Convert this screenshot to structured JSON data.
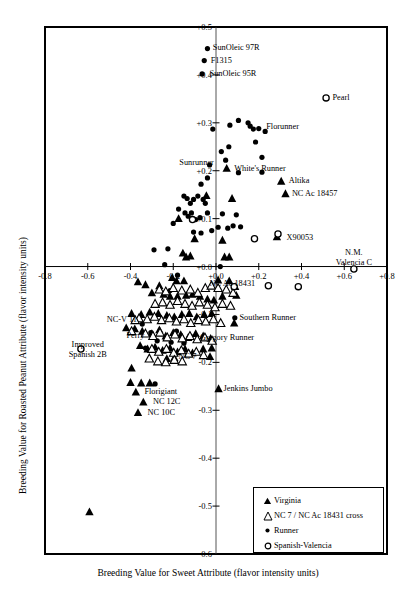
{
  "chart_data": {
    "type": "scatter",
    "title": "",
    "xlabel": "Breeding Value for Sweet Attribute (flavor intensity units)",
    "ylabel": "Breeding Value for Roasted Peanut Attribute (flavor intensity units)",
    "xlim": [
      -0.8,
      0.8
    ],
    "ylim": [
      -0.6,
      0.5
    ],
    "xticks": [
      "-0.8",
      "-0.6",
      "-0.4",
      "-0.2",
      "+0.0",
      "+0.2",
      "+0.4",
      "+0.6",
      "+0.8"
    ],
    "xtick_values": [
      -0.8,
      -0.6,
      -0.4,
      -0.2,
      0.0,
      0.2,
      0.4,
      0.6,
      0.8
    ],
    "yticks": [
      "+0.5",
      "+0.4",
      "+0.3",
      "+0.2",
      "+0.1",
      "+0.0",
      "-0.1",
      "-0.2",
      "-0.3",
      "-0.4",
      "-0.5",
      "-0.6"
    ],
    "ytick_values": [
      0.5,
      0.4,
      0.3,
      0.2,
      0.1,
      0.0,
      -0.1,
      -0.2,
      -0.3,
      -0.4,
      -0.5,
      -0.6
    ],
    "grid": false,
    "legend_position": "bottom-right",
    "legend": [
      {
        "label": "Virginia",
        "marker": "filled-triangle"
      },
      {
        "label": "NC 7 / NC Ac 18431 cross",
        "marker": "open-triangle"
      },
      {
        "label": "Runner",
        "marker": "filled-circle"
      },
      {
        "label": "Spanish-Valencia",
        "marker": "open-circle"
      }
    ],
    "annotations": [
      {
        "text": "SunOleic 97R",
        "x": -0.015,
        "y": 0.456,
        "anchor": "l"
      },
      {
        "text": "F1315",
        "x": -0.025,
        "y": 0.43,
        "anchor": "l"
      },
      {
        "text": "SunOleic 95R",
        "x": -0.03,
        "y": 0.402,
        "anchor": "l"
      },
      {
        "text": "Pearl",
        "x": 0.545,
        "y": 0.352,
        "anchor": "l"
      },
      {
        "text": "Florunner",
        "x": 0.235,
        "y": 0.292,
        "anchor": "l"
      },
      {
        "text": "Sunrunner",
        "x": -0.01,
        "y": 0.216,
        "anchor": "r"
      },
      {
        "text": "White's Runner",
        "x": 0.085,
        "y": 0.203,
        "anchor": "l"
      },
      {
        "text": "Altika",
        "x": 0.34,
        "y": 0.178,
        "anchor": "l"
      },
      {
        "text": "NC Ac 18457",
        "x": 0.355,
        "y": 0.152,
        "anchor": "l"
      },
      {
        "text": "X90053",
        "x": 0.33,
        "y": 0.06,
        "anchor": "l"
      },
      {
        "text": "N.M.",
        "x": 0.645,
        "y": 0.028,
        "anchor": "c"
      },
      {
        "text": "Valencia C",
        "x": 0.645,
        "y": 0.007,
        "anchor": "c"
      },
      {
        "text": "NC Ac 18431",
        "x": -0.03,
        "y": -0.037,
        "anchor": "l"
      },
      {
        "text": "Southern Runner",
        "x": 0.11,
        "y": -0.108,
        "anchor": "l"
      },
      {
        "text": "NC-V 11",
        "x": -0.37,
        "y": -0.112,
        "anchor": "r"
      },
      {
        "text": "Gregory Runner",
        "x": -0.075,
        "y": -0.15,
        "anchor": "l"
      },
      {
        "text": "Perry",
        "x": -0.335,
        "y": -0.145,
        "anchor": "r"
      },
      {
        "text": "Improved",
        "x": -0.6,
        "y": -0.163,
        "anchor": "c"
      },
      {
        "text": "Spanish 2B",
        "x": -0.6,
        "y": -0.184,
        "anchor": "c"
      },
      {
        "text": "NC 7",
        "x": -0.175,
        "y": -0.188,
        "anchor": "l"
      },
      {
        "text": "Jenkins Jumbo",
        "x": 0.035,
        "y": -0.255,
        "anchor": "l"
      },
      {
        "text": "Florigiant",
        "x": -0.335,
        "y": -0.262,
        "anchor": "l"
      },
      {
        "text": "NC 12C",
        "x": -0.295,
        "y": -0.283,
        "anchor": "l"
      },
      {
        "text": "NC 10C",
        "x": -0.32,
        "y": -0.305,
        "anchor": "l"
      }
    ],
    "series": [
      {
        "name": "Runner",
        "marker": "filled-circle",
        "points": [
          [
            -0.04,
            0.455
          ],
          [
            -0.055,
            0.43
          ],
          [
            -0.065,
            0.402
          ],
          [
            -0.015,
            0.287
          ],
          [
            0.025,
            0.24
          ],
          [
            -0.03,
            0.212
          ],
          [
            0.105,
            0.305
          ],
          [
            0.15,
            0.3
          ],
          [
            0.16,
            0.293
          ],
          [
            0.175,
            0.287
          ],
          [
            0.065,
            0.295
          ],
          [
            0.2,
            0.288
          ],
          [
            0.185,
            0.26
          ],
          [
            0.06,
            0.25
          ],
          [
            0.23,
            0.282
          ],
          [
            0.215,
            0.228
          ],
          [
            0.045,
            0.222
          ],
          [
            0.105,
            0.196
          ],
          [
            0.215,
            0.197
          ],
          [
            -0.04,
            0.185
          ],
          [
            -0.07,
            0.172
          ],
          [
            -0.15,
            0.147
          ],
          [
            -0.135,
            0.142
          ],
          [
            -0.105,
            0.14
          ],
          [
            -0.085,
            0.147
          ],
          [
            -0.12,
            0.132
          ],
          [
            -0.06,
            0.14
          ],
          [
            -0.05,
            0.132
          ],
          [
            -0.175,
            0.12
          ],
          [
            -0.145,
            0.112
          ],
          [
            -0.115,
            0.112
          ],
          [
            -0.13,
            0.105
          ],
          [
            -0.095,
            0.098
          ],
          [
            -0.075,
            0.102
          ],
          [
            -0.04,
            0.112
          ],
          [
            0.03,
            0.11
          ],
          [
            0.095,
            0.108
          ],
          [
            0.08,
            0.085
          ],
          [
            0.115,
            0.083
          ],
          [
            0.01,
            0.082
          ],
          [
            0.055,
            0.08
          ],
          [
            -0.02,
            0.075
          ],
          [
            -0.2,
            0.09
          ],
          [
            -0.105,
            0.072
          ],
          [
            -0.07,
            0.07
          ],
          [
            -0.29,
            0.035
          ],
          [
            -0.225,
            0.037
          ],
          [
            -0.24,
            0.004
          ],
          [
            0.02,
            0.0
          ],
          [
            -0.18,
            -0.018
          ],
          [
            -0.215,
            -0.05
          ],
          [
            -0.345,
            -0.12
          ],
          [
            -0.305,
            -0.138
          ],
          [
            -0.275,
            -0.155
          ],
          [
            -0.33,
            -0.17
          ],
          [
            -0.21,
            -0.158
          ],
          [
            -0.185,
            -0.135
          ],
          [
            -0.285,
            -0.245
          ],
          [
            0.088,
            -0.107
          ],
          [
            -0.12,
            -0.145
          ],
          [
            -0.15,
            -0.16
          ]
        ]
      },
      {
        "name": "Virginia",
        "marker": "filled-triangle",
        "points": [
          [
            0.05,
            0.205
          ],
          [
            0.305,
            0.178
          ],
          [
            0.325,
            0.152
          ],
          [
            0.075,
            0.142
          ],
          [
            -0.045,
            0.148
          ],
          [
            -0.175,
            0.1
          ],
          [
            -0.1,
            0.058
          ],
          [
            0.03,
            0.055
          ],
          [
            0.285,
            0.062
          ],
          [
            -0.155,
            0.028
          ],
          [
            -0.14,
            0.02
          ],
          [
            -0.12,
            0.022
          ],
          [
            0.04,
            0.02
          ],
          [
            0.062,
            0.02
          ],
          [
            -0.205,
            -0.023
          ],
          [
            -0.185,
            -0.03
          ],
          [
            -0.15,
            -0.03
          ],
          [
            0.01,
            -0.028
          ],
          [
            0.062,
            -0.03
          ],
          [
            0.09,
            -0.042
          ],
          [
            -0.265,
            -0.04
          ],
          [
            -0.33,
            -0.038
          ],
          [
            -0.365,
            -0.032
          ],
          [
            -0.3,
            -0.055
          ],
          [
            -0.245,
            -0.058
          ],
          [
            -0.215,
            -0.062
          ],
          [
            -0.18,
            -0.062
          ],
          [
            -0.14,
            -0.06
          ],
          [
            -0.11,
            -0.058
          ],
          [
            -0.075,
            -0.062
          ],
          [
            -0.04,
            -0.068
          ],
          [
            -0.01,
            -0.07
          ],
          [
            0.03,
            -0.062
          ],
          [
            0.095,
            -0.06
          ],
          [
            -0.395,
            -0.098
          ],
          [
            -0.35,
            -0.1
          ],
          [
            -0.31,
            -0.095
          ],
          [
            -0.27,
            -0.098
          ],
          [
            -0.23,
            -0.102
          ],
          [
            -0.195,
            -0.105
          ],
          [
            -0.16,
            -0.1
          ],
          [
            -0.125,
            -0.098
          ],
          [
            -0.09,
            -0.105
          ],
          [
            -0.055,
            -0.1
          ],
          [
            -0.02,
            -0.098
          ],
          [
            0.085,
            -0.118
          ],
          [
            -0.42,
            -0.128
          ],
          [
            -0.38,
            -0.13
          ],
          [
            -0.345,
            -0.135
          ],
          [
            -0.3,
            -0.14
          ],
          [
            -0.265,
            -0.132
          ],
          [
            -0.235,
            -0.145
          ],
          [
            -0.2,
            -0.138
          ],
          [
            -0.165,
            -0.142
          ],
          [
            -0.13,
            -0.148
          ],
          [
            -0.095,
            -0.14
          ],
          [
            -0.06,
            -0.145
          ],
          [
            -0.025,
            -0.15
          ],
          [
            -0.355,
            -0.165
          ],
          [
            -0.32,
            -0.172
          ],
          [
            -0.285,
            -0.168
          ],
          [
            -0.25,
            -0.175
          ],
          [
            -0.215,
            -0.17
          ],
          [
            -0.18,
            -0.178
          ],
          [
            -0.145,
            -0.172
          ],
          [
            -0.11,
            -0.18
          ],
          [
            -0.06,
            -0.172
          ],
          [
            -0.02,
            -0.17
          ],
          [
            -0.028,
            -0.188
          ],
          [
            -0.23,
            -0.192
          ],
          [
            -0.195,
            -0.19
          ],
          [
            -0.395,
            -0.212
          ],
          [
            -0.4,
            -0.242
          ],
          [
            -0.35,
            -0.243
          ],
          [
            -0.31,
            -0.243
          ],
          [
            -0.375,
            -0.262
          ],
          [
            -0.34,
            -0.283
          ],
          [
            -0.365,
            -0.305
          ],
          [
            0.012,
            -0.255
          ],
          [
            -0.592,
            -0.512
          ]
        ]
      },
      {
        "name": "NC 7 / NC Ac 18431 cross",
        "marker": "open-triangle",
        "points": [
          [
            -0.265,
            -0.048
          ],
          [
            -0.235,
            -0.052
          ],
          [
            -0.2,
            -0.045
          ],
          [
            -0.16,
            -0.05
          ],
          [
            -0.12,
            -0.048
          ],
          [
            -0.085,
            -0.055
          ],
          [
            -0.05,
            -0.045
          ],
          [
            -0.022,
            -0.04
          ],
          [
            0.01,
            -0.045
          ],
          [
            0.048,
            -0.048
          ],
          [
            0.08,
            -0.055
          ],
          [
            -0.285,
            -0.078
          ],
          [
            -0.25,
            -0.075
          ],
          [
            -0.215,
            -0.08
          ],
          [
            -0.18,
            -0.072
          ],
          [
            -0.145,
            -0.078
          ],
          [
            -0.112,
            -0.082
          ],
          [
            -0.078,
            -0.075
          ],
          [
            -0.04,
            -0.08
          ],
          [
            -0.005,
            -0.085
          ],
          [
            0.03,
            -0.078
          ],
          [
            0.068,
            -0.082
          ],
          [
            -0.36,
            -0.108
          ],
          [
            -0.322,
            -0.11
          ],
          [
            -0.288,
            -0.105
          ],
          [
            -0.255,
            -0.112
          ],
          [
            -0.218,
            -0.108
          ],
          [
            -0.185,
            -0.115
          ],
          [
            -0.15,
            -0.11
          ],
          [
            -0.118,
            -0.118
          ],
          [
            -0.082,
            -0.112
          ],
          [
            -0.048,
            -0.115
          ],
          [
            -0.012,
            -0.11
          ],
          [
            0.022,
            -0.118
          ],
          [
            -0.33,
            -0.14
          ],
          [
            -0.295,
            -0.145
          ],
          [
            -0.262,
            -0.138
          ],
          [
            -0.228,
            -0.148
          ],
          [
            -0.192,
            -0.142
          ],
          [
            -0.158,
            -0.15
          ],
          [
            -0.122,
            -0.145
          ],
          [
            -0.088,
            -0.152
          ],
          [
            -0.052,
            -0.148
          ],
          [
            -0.018,
            -0.155
          ],
          [
            -0.3,
            -0.172
          ],
          [
            -0.268,
            -0.178
          ],
          [
            -0.232,
            -0.172
          ],
          [
            -0.198,
            -0.18
          ],
          [
            -0.162,
            -0.175
          ],
          [
            -0.128,
            -0.182
          ],
          [
            -0.092,
            -0.178
          ],
          [
            -0.058,
            -0.185
          ],
          [
            -0.272,
            -0.198
          ],
          [
            -0.235,
            -0.2
          ],
          [
            -0.195,
            -0.195
          ],
          [
            -0.312,
            -0.192
          ],
          [
            -0.158,
            -0.198
          ],
          [
            -0.395,
            -0.135
          ],
          [
            -0.378,
            -0.112
          ]
        ]
      },
      {
        "name": "Spanish-Valencia",
        "marker": "open-circle",
        "points": [
          [
            0.515,
            0.352
          ],
          [
            0.29,
            0.068
          ],
          [
            0.18,
            0.058
          ],
          [
            -0.11,
            0.098
          ],
          [
            0.645,
            -0.005
          ],
          [
            0.245,
            -0.04
          ],
          [
            0.385,
            -0.042
          ],
          [
            0.085,
            -0.042
          ],
          [
            -0.632,
            -0.172
          ]
        ]
      }
    ]
  }
}
